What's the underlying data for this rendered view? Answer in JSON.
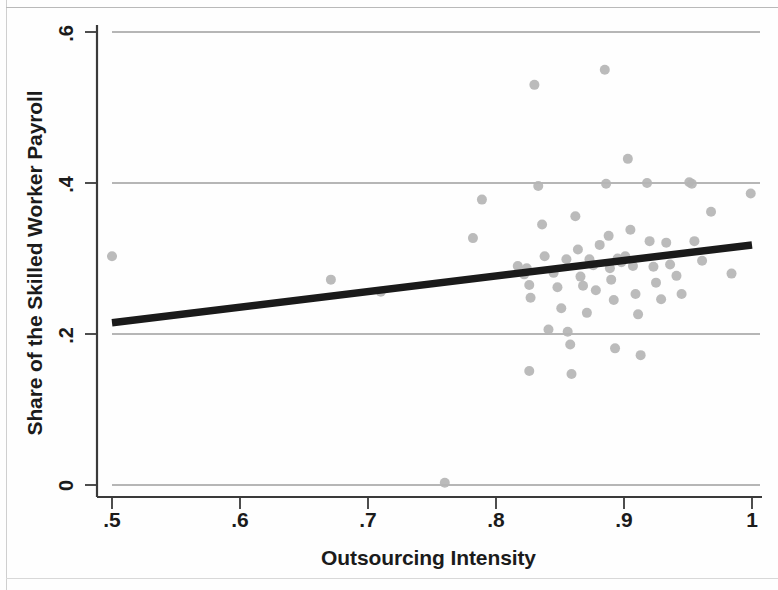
{
  "chart_data": {
    "type": "scatter",
    "title": "",
    "xlabel": "Outsourcing Intensity",
    "ylabel": "Share of the Skilled Worker Payroll",
    "xlim": [
      0.5,
      1.0
    ],
    "ylim": [
      0.0,
      0.6
    ],
    "xticks": [
      0.5,
      0.6,
      0.7,
      0.8,
      0.9,
      1.0
    ],
    "xtick_labels": [
      ".5",
      ".6",
      ".7",
      ".8",
      ".9",
      "1"
    ],
    "yticks": [
      0.0,
      0.2,
      0.4,
      0.6
    ],
    "ytick_labels": [
      "0",
      ".2",
      ".4",
      ".6"
    ],
    "grid": "horizontal",
    "legend": null,
    "marker_color": "#b5b5b5",
    "line_color": "#1a1a1a",
    "grid_color": "#6f6f6f",
    "axis_color": "#3a3a3a",
    "fit_line": {
      "name": "linear fit",
      "x": [
        0.5,
        1.0
      ],
      "y": [
        0.215,
        0.318
      ],
      "slope": 0.206,
      "intercept": 0.112
    },
    "points": [
      {
        "x": 0.5,
        "y": 0.303
      },
      {
        "x": 0.671,
        "y": 0.272
      },
      {
        "x": 0.71,
        "y": 0.256
      },
      {
        "x": 0.76,
        "y": 0.003
      },
      {
        "x": 0.789,
        "y": 0.378
      },
      {
        "x": 0.782,
        "y": 0.327
      },
      {
        "x": 0.817,
        "y": 0.29
      },
      {
        "x": 0.822,
        "y": 0.279
      },
      {
        "x": 0.824,
        "y": 0.287
      },
      {
        "x": 0.826,
        "y": 0.265
      },
      {
        "x": 0.827,
        "y": 0.248
      },
      {
        "x": 0.826,
        "y": 0.151
      },
      {
        "x": 0.83,
        "y": 0.53
      },
      {
        "x": 0.833,
        "y": 0.396
      },
      {
        "x": 0.836,
        "y": 0.345
      },
      {
        "x": 0.838,
        "y": 0.303
      },
      {
        "x": 0.841,
        "y": 0.206
      },
      {
        "x": 0.845,
        "y": 0.281
      },
      {
        "x": 0.848,
        "y": 0.262
      },
      {
        "x": 0.851,
        "y": 0.234
      },
      {
        "x": 0.855,
        "y": 0.299
      },
      {
        "x": 0.856,
        "y": 0.203
      },
      {
        "x": 0.858,
        "y": 0.186
      },
      {
        "x": 0.859,
        "y": 0.147
      },
      {
        "x": 0.862,
        "y": 0.356
      },
      {
        "x": 0.864,
        "y": 0.312
      },
      {
        "x": 0.866,
        "y": 0.276
      },
      {
        "x": 0.868,
        "y": 0.264
      },
      {
        "x": 0.871,
        "y": 0.228
      },
      {
        "x": 0.873,
        "y": 0.299
      },
      {
        "x": 0.876,
        "y": 0.291
      },
      {
        "x": 0.878,
        "y": 0.258
      },
      {
        "x": 0.881,
        "y": 0.318
      },
      {
        "x": 0.885,
        "y": 0.55
      },
      {
        "x": 0.886,
        "y": 0.399
      },
      {
        "x": 0.888,
        "y": 0.33
      },
      {
        "x": 0.889,
        "y": 0.287
      },
      {
        "x": 0.89,
        "y": 0.272
      },
      {
        "x": 0.892,
        "y": 0.245
      },
      {
        "x": 0.893,
        "y": 0.181
      },
      {
        "x": 0.895,
        "y": 0.3
      },
      {
        "x": 0.898,
        "y": 0.295
      },
      {
        "x": 0.901,
        "y": 0.303
      },
      {
        "x": 0.903,
        "y": 0.432
      },
      {
        "x": 0.905,
        "y": 0.338
      },
      {
        "x": 0.907,
        "y": 0.29
      },
      {
        "x": 0.909,
        "y": 0.253
      },
      {
        "x": 0.911,
        "y": 0.226
      },
      {
        "x": 0.913,
        "y": 0.172
      },
      {
        "x": 0.918,
        "y": 0.4
      },
      {
        "x": 0.92,
        "y": 0.323
      },
      {
        "x": 0.923,
        "y": 0.289
      },
      {
        "x": 0.925,
        "y": 0.268
      },
      {
        "x": 0.929,
        "y": 0.246
      },
      {
        "x": 0.933,
        "y": 0.321
      },
      {
        "x": 0.936,
        "y": 0.292
      },
      {
        "x": 0.941,
        "y": 0.277
      },
      {
        "x": 0.945,
        "y": 0.253
      },
      {
        "x": 0.951,
        "y": 0.401
      },
      {
        "x": 0.953,
        "y": 0.399
      },
      {
        "x": 0.955,
        "y": 0.323
      },
      {
        "x": 0.961,
        "y": 0.297
      },
      {
        "x": 0.968,
        "y": 0.362
      },
      {
        "x": 0.984,
        "y": 0.28
      },
      {
        "x": 0.999,
        "y": 0.386
      }
    ]
  },
  "figure": {
    "xlabel": "Outsourcing Intensity",
    "ylabel": "Share of the Skilled Worker Payroll",
    "xtick_0": ".5",
    "xtick_1": ".6",
    "xtick_2": ".7",
    "xtick_3": ".8",
    "xtick_4": ".9",
    "xtick_5": "1",
    "ytick_0": "0",
    "ytick_1": ".2",
    "ytick_2": ".4",
    "ytick_3": ".6"
  }
}
